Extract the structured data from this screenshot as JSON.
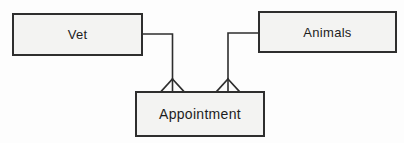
{
  "diagram": {
    "type": "entity-relationship",
    "entities": [
      {
        "id": "vet",
        "label": "Vet"
      },
      {
        "id": "animals",
        "label": "Animals"
      },
      {
        "id": "appointment",
        "label": "Appointment"
      }
    ],
    "relationships": [
      {
        "from": "Vet",
        "to": "Appointment",
        "notation": "crow-foot",
        "cardinality_at_to": "many"
      },
      {
        "from": "Animals",
        "to": "Appointment",
        "notation": "crow-foot",
        "cardinality_at_to": "many"
      }
    ],
    "colors": {
      "background": "#fdfdfd",
      "entity_fill": "#f3f3f2",
      "entity_border": "#2e2e2e",
      "connector": "#2e2e2e",
      "text": "#1d1d1d"
    }
  }
}
